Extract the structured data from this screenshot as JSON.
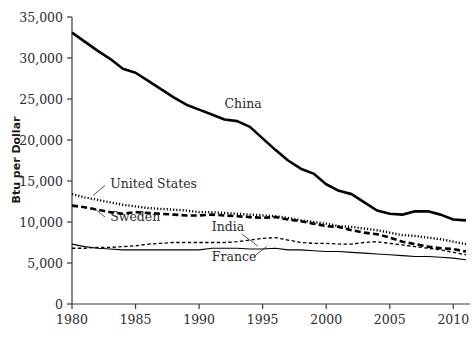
{
  "chart_data": {
    "type": "line",
    "title": "",
    "xlabel": "",
    "ylabel": "Btu per Dollar",
    "xlim": [
      1980,
      2011
    ],
    "ylim": [
      0,
      35000
    ],
    "grid": false,
    "legend_position": "inline-labels",
    "x_ticks": [
      "1980",
      "1985",
      "1990",
      "1995",
      "2000",
      "2005",
      "2010"
    ],
    "x_tick_values": [
      1980,
      1985,
      1990,
      1995,
      2000,
      2005,
      2010
    ],
    "y_ticks": [
      "0",
      "5,000",
      "10,000",
      "15,000",
      "20,000",
      "25,000",
      "30,000",
      "35,000"
    ],
    "y_tick_values": [
      0,
      5000,
      10000,
      15000,
      20000,
      25000,
      30000,
      35000
    ],
    "x": [
      1980,
      1981,
      1982,
      1983,
      1984,
      1985,
      1986,
      1987,
      1988,
      1989,
      1990,
      1991,
      1992,
      1993,
      1994,
      1995,
      1996,
      1997,
      1998,
      1999,
      2000,
      2001,
      2002,
      2003,
      2004,
      2005,
      2006,
      2007,
      2008,
      2009,
      2010,
      2011
    ],
    "series": [
      {
        "name": "China",
        "style": "solid-thick",
        "label": "China",
        "values": [
          33100,
          32000,
          30900,
          29900,
          28700,
          28200,
          27200,
          26200,
          25200,
          24300,
          23700,
          23100,
          22500,
          22300,
          21600,
          20200,
          18800,
          17500,
          16500,
          15900,
          14600,
          13800,
          13400,
          12400,
          11400,
          11000,
          10900,
          11300,
          11300,
          10900,
          10300,
          10200
        ]
      },
      {
        "name": "United States",
        "style": "dotted",
        "label": "United States",
        "values": [
          13400,
          13000,
          12700,
          12400,
          12100,
          11900,
          11700,
          11600,
          11500,
          11400,
          11200,
          11200,
          11100,
          11000,
          10900,
          10800,
          10700,
          10500,
          10200,
          10000,
          9800,
          9500,
          9400,
          9200,
          9000,
          8700,
          8400,
          8300,
          8100,
          7900,
          7600,
          7300
        ]
      },
      {
        "name": "Sweden",
        "style": "dashed-thick",
        "label": "Sweden",
        "values": [
          12000,
          11800,
          11500,
          11200,
          11000,
          11200,
          11100,
          11000,
          10900,
          10800,
          10800,
          10900,
          10800,
          10700,
          10600,
          10500,
          10600,
          10300,
          10100,
          9800,
          9500,
          9400,
          9000,
          8700,
          8500,
          8100,
          7600,
          7300,
          7000,
          6800,
          6700,
          6400
        ]
      },
      {
        "name": "India",
        "style": "dashed-thin",
        "label": "India",
        "values": [
          6800,
          6800,
          6900,
          6900,
          7000,
          7100,
          7300,
          7400,
          7500,
          7500,
          7500,
          7500,
          7500,
          7600,
          7800,
          8000,
          8100,
          7800,
          7500,
          7400,
          7400,
          7300,
          7300,
          7500,
          7600,
          7400,
          7200,
          7000,
          6800,
          6600,
          6300,
          6000
        ]
      },
      {
        "name": "France",
        "style": "solid-thin",
        "label": "France",
        "values": [
          7300,
          7000,
          6800,
          6700,
          6600,
          6600,
          6600,
          6600,
          6600,
          6600,
          6600,
          6800,
          6800,
          6800,
          6700,
          6700,
          6800,
          6600,
          6600,
          6500,
          6400,
          6400,
          6300,
          6200,
          6100,
          6000,
          5900,
          5800,
          5800,
          5700,
          5600,
          5400
        ]
      }
    ],
    "annotations": [
      {
        "text": "China",
        "series": "China",
        "x": 1992,
        "y": 23900
      },
      {
        "text": "United States",
        "series": "United States",
        "x": 1983,
        "y": 14100
      },
      {
        "text": "Sweden",
        "series": "Sweden",
        "x": 1983,
        "y": 10100
      },
      {
        "text": "India",
        "series": "India",
        "x": 1991,
        "y": 8900
      },
      {
        "text": "France",
        "series": "France",
        "x": 1991,
        "y": 5300
      }
    ]
  }
}
